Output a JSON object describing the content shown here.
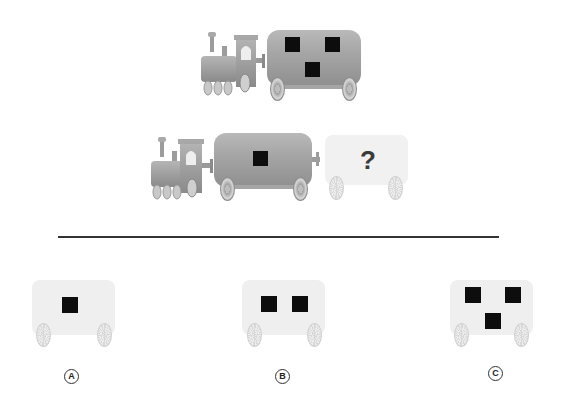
{
  "puzzle": {
    "type": "train-pattern-analogy",
    "top_train": {
      "locomotive": "steam-locomotive",
      "car_squares": 3,
      "car_style": "dark"
    },
    "bottom_train": {
      "locomotive": "steam-locomotive",
      "car_squares": 1,
      "car_style": "dark",
      "unknown_car_label": "?"
    },
    "options": [
      {
        "label": "A",
        "squares": 1
      },
      {
        "label": "B",
        "squares": 2
      },
      {
        "label": "C",
        "squares": 3
      }
    ]
  },
  "colors": {
    "square": "#0d0d0d",
    "divider": "#333333",
    "background": "#ffffff"
  }
}
